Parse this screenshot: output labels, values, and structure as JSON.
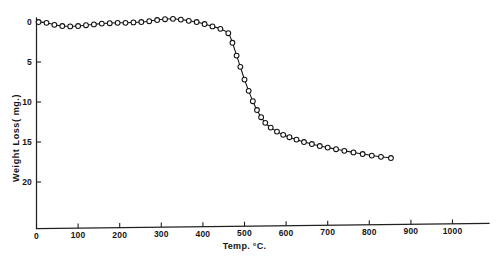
{
  "chart_data": {
    "type": "line",
    "title": "",
    "xlabel": "Temp. °C.",
    "ylabel": "Weight  Loss( mg.)",
    "xlim": [
      0,
      1100
    ],
    "ylim": [
      -1.5,
      22
    ],
    "y_inverted": true,
    "grid": false,
    "legend": null,
    "marker": "open-circle",
    "x_ticks": [
      0,
      100,
      200,
      300,
      400,
      500,
      600,
      700,
      800,
      900,
      1000
    ],
    "x_tick_labels": [
      "0",
      "100",
      "200",
      "300",
      "400",
      "500",
      "600",
      "700",
      "800",
      "900",
      "1000"
    ],
    "y_ticks": [
      0,
      5,
      10,
      15,
      20
    ],
    "y_tick_labels": [
      "0",
      "5",
      "10",
      "15",
      "20"
    ],
    "series": [
      {
        "name": "Weight Loss",
        "x": [
          5,
          24,
          43,
          62,
          81,
          100,
          119,
          138,
          157,
          176,
          195,
          214,
          233,
          252,
          271,
          290,
          309,
          328,
          347,
          366,
          385,
          404,
          423,
          442,
          461,
          471,
          481,
          490,
          500,
          510,
          520,
          530,
          540,
          550,
          563,
          578,
          593,
          608,
          625,
          643,
          662,
          681,
          700,
          720,
          740,
          762,
          784,
          806,
          828,
          852
        ],
        "y": [
          0.0,
          0.1,
          0.35,
          0.5,
          0.55,
          0.5,
          0.4,
          0.3,
          0.2,
          0.15,
          0.1,
          0.1,
          0.05,
          0.0,
          -0.1,
          -0.25,
          -0.35,
          -0.4,
          -0.3,
          -0.15,
          0.0,
          0.25,
          0.55,
          0.85,
          1.4,
          2.6,
          4.2,
          5.6,
          7.2,
          8.6,
          9.9,
          11.0,
          11.9,
          12.6,
          13.2,
          13.7,
          14.1,
          14.4,
          14.7,
          15.0,
          15.25,
          15.5,
          15.7,
          15.9,
          16.1,
          16.3,
          16.5,
          16.7,
          16.85,
          17.0
        ]
      }
    ]
  },
  "axis": {
    "x_axis_name": "temperature-axis",
    "y_axis_name": "weight-loss-axis"
  }
}
